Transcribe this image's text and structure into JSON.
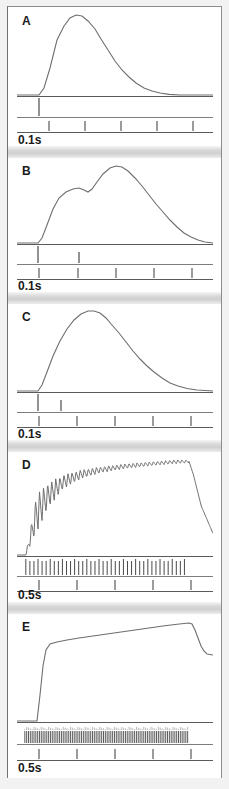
{
  "figure": {
    "panel_count": 5,
    "stroke_color": "#6e6e6e",
    "axis_color": "#5a5a5a",
    "background_color": "#ffffff"
  },
  "panels": [
    {
      "label": "A",
      "scale_label": "0.1s",
      "stimulus_count": 1,
      "time_ticks": 5,
      "description": "single twitch"
    },
    {
      "label": "B",
      "scale_label": "0.1s",
      "stimulus_count": 2,
      "time_ticks": 5,
      "description": "partial summation, two distinct peaks"
    },
    {
      "label": "C",
      "scale_label": "0.1s",
      "stimulus_count": 2,
      "time_ticks": 5,
      "description": "fused summation, single larger peak"
    },
    {
      "label": "D",
      "scale_label": "0.5s",
      "stimulus_count": 40,
      "time_ticks": 5,
      "description": "unfused tetanus with rippled plateau"
    },
    {
      "label": "E",
      "scale_label": "0.5s",
      "stimulus_count": 90,
      "time_ticks": 5,
      "description": "fused tetanus, smooth plateau"
    }
  ],
  "chart_data": {
    "type": "line",
    "xlabel": "",
    "ylabel": "",
    "grid": false,
    "legend": "none",
    "panels": [
      {
        "label": "A",
        "time_scale_bar": "0.1s",
        "time_tick_count": 5,
        "stimulus_times": [
          0.055
        ],
        "series": [
          {
            "name": "tension",
            "x": [
              0.0,
              0.04,
              0.055,
              0.07,
              0.09,
              0.12,
              0.15,
              0.18,
              0.21,
              0.24,
              0.27,
              0.3,
              0.34,
              0.38,
              0.43,
              0.48,
              0.54,
              0.6,
              0.68,
              0.76,
              0.85,
              1.0
            ],
            "y": [
              0.0,
              0.0,
              0.0,
              0.09,
              0.34,
              0.68,
              0.88,
              0.97,
              1.0,
              0.98,
              0.92,
              0.83,
              0.7,
              0.57,
              0.43,
              0.31,
              0.21,
              0.14,
              0.08,
              0.04,
              0.02,
              0.0
            ]
          }
        ]
      },
      {
        "label": "B",
        "time_scale_bar": "0.1s",
        "time_tick_count": 5,
        "stimulus_times": [
          0.055,
          0.225
        ],
        "series": [
          {
            "name": "tension",
            "x": [
              0.0,
              0.045,
              0.06,
              0.09,
              0.13,
              0.17,
              0.205,
              0.225,
              0.245,
              0.26,
              0.3,
              0.34,
              0.375,
              0.41,
              0.45,
              0.5,
              0.55,
              0.61,
              0.67,
              0.74,
              0.81,
              0.88,
              0.95,
              1.0
            ],
            "y": [
              0.0,
              0.0,
              0.06,
              0.32,
              0.58,
              0.7,
              0.73,
              0.7,
              0.66,
              0.7,
              0.87,
              0.97,
              1.0,
              0.99,
              0.94,
              0.85,
              0.73,
              0.59,
              0.45,
              0.3,
              0.17,
              0.08,
              0.02,
              0.0
            ]
          }
        ]
      },
      {
        "label": "C",
        "time_scale_bar": "0.1s",
        "time_tick_count": 5,
        "stimulus_times": [
          0.055,
          0.145
        ],
        "series": [
          {
            "name": "tension",
            "x": [
              0.0,
              0.045,
              0.06,
              0.09,
              0.13,
              0.17,
              0.21,
              0.25,
              0.29,
              0.33,
              0.37,
              0.42,
              0.47,
              0.52,
              0.57,
              0.63,
              0.69,
              0.75,
              0.82,
              0.89,
              0.95,
              1.0
            ],
            "y": [
              0.0,
              0.0,
              0.07,
              0.3,
              0.58,
              0.8,
              0.94,
              1.0,
              0.99,
              0.95,
              0.88,
              0.78,
              0.66,
              0.54,
              0.42,
              0.3,
              0.2,
              0.12,
              0.06,
              0.02,
              0.01,
              0.0
            ]
          }
        ]
      },
      {
        "label": "D",
        "time_scale_bar": "0.5s",
        "time_tick_count": 5,
        "stimulus_count": 40,
        "stimulus_start": 0.045,
        "stimulus_end": 0.875,
        "series": [
          {
            "name": "tension_envelope_upper",
            "x": [
              0.045,
              0.1,
              0.16,
              0.24,
              0.33,
              0.43,
              0.55,
              0.68,
              0.8,
              0.875,
              0.9,
              0.94,
              1.0
            ],
            "y": [
              0.0,
              0.63,
              0.74,
              0.82,
              0.87,
              0.9,
              0.93,
              0.95,
              0.97,
              0.97,
              0.82,
              0.5,
              0.22
            ]
          },
          {
            "name": "tension_envelope_lower",
            "x": [
              0.045,
              0.1,
              0.16,
              0.24,
              0.33,
              0.43,
              0.55,
              0.68,
              0.8,
              0.875
            ],
            "y": [
              0.0,
              0.22,
              0.48,
              0.68,
              0.78,
              0.84,
              0.88,
              0.91,
              0.93,
              0.94
            ]
          }
        ],
        "ripple_note": "oscillation amplitude decreases from large at onset to small at plateau"
      },
      {
        "label": "E",
        "time_scale_bar": "0.5s",
        "time_tick_count": 5,
        "stimulus_count": 90,
        "stimulus_start": 0.04,
        "stimulus_end": 0.88,
        "series": [
          {
            "name": "tension",
            "x": [
              0.0,
              0.035,
              0.05,
              0.075,
              0.11,
              0.18,
              0.27,
              0.38,
              0.5,
              0.62,
              0.74,
              0.84,
              0.885,
              0.91,
              0.95,
              1.0
            ],
            "y": [
              0.0,
              0.0,
              0.48,
              0.78,
              0.82,
              0.85,
              0.88,
              0.91,
              0.94,
              0.96,
              0.98,
              0.995,
              1.0,
              0.86,
              0.7,
              0.64
            ]
          }
        ]
      }
    ]
  }
}
